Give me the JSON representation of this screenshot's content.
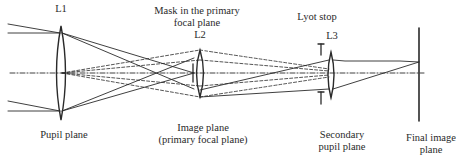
{
  "diagram": {
    "type": "optical-schematic",
    "colors": {
      "line": "#2a2a2a",
      "background": "#ffffff"
    },
    "labels": {
      "l1": "L1",
      "l2": "L2",
      "l3": "L3",
      "mask_line1": "Mask in the primary",
      "mask_line2": "focal plane",
      "lyot_stop": "Lyot stop",
      "pupil_plane": "Pupil plane",
      "image_plane_line1": "Image plane",
      "image_plane_line2": "(primary focal plane)",
      "secondary_pupil_line1": "Secondary",
      "secondary_pupil_line2": "pupil plane",
      "final_image_line1": "Final image",
      "final_image_line2": "plane"
    },
    "elements": [
      {
        "id": "L1",
        "kind": "lens",
        "plane": "Pupil plane"
      },
      {
        "id": "mask",
        "kind": "occulting-mask",
        "plane": "Image plane (primary focal plane)"
      },
      {
        "id": "L2",
        "kind": "lens"
      },
      {
        "id": "lyot-stop",
        "kind": "aperture-stop",
        "plane": "Secondary pupil plane"
      },
      {
        "id": "L3",
        "kind": "lens"
      },
      {
        "id": "final-image-plane",
        "kind": "detector-plane"
      }
    ],
    "rays": {
      "solid": "on-axis and off-axis beams focused by L1 onto the image plane, then relayed by L3 to the final image plane",
      "dashed": "diffracted light imaged by L2 onto the Lyot stop"
    }
  }
}
